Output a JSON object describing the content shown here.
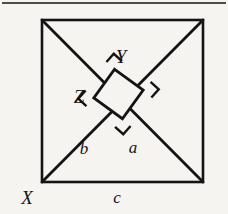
{
  "figure": {
    "kind": "geometry-diagram",
    "background_color": "#f6f4f1",
    "ink_color": "#141414",
    "top_rule": {
      "name": "horizontal-rule",
      "x1": 2,
      "y1": 3,
      "x2": 226,
      "y2": 3,
      "stroke_width": 1.6
    },
    "outer_square": {
      "name": "outer-square",
      "x": 42,
      "y": 20,
      "width": 161,
      "height": 162,
      "stroke_width": 2.6
    },
    "diagonals": [
      {
        "name": "diagonal-top-left-to-bottom-right",
        "x1": 42,
        "y1": 20,
        "x2": 203,
        "y2": 182,
        "stroke_width": 2.8
      },
      {
        "name": "diagonal-bottom-left-to-top-right",
        "x1": 42,
        "y1": 182,
        "x2": 203,
        "y2": 20,
        "stroke_width": 2.8
      }
    ],
    "inner_square": {
      "name": "inner-tilted-square",
      "center_x": 118.5,
      "center_y": 94,
      "half_diagonal": 25,
      "rotation_deg": 42,
      "stroke_width": 2.8,
      "fill": "#f6f4f1",
      "vertices": [
        {
          "x": 114.6,
          "y": 69.3
        },
        {
          "x": 143.2,
          "y": 90.1
        },
        {
          "x": 122.4,
          "y": 118.7
        },
        {
          "x": 93.8,
          "y": 97.9
        }
      ]
    },
    "right_angle_marks": [
      {
        "name": "right-angle-mark-top",
        "cx": 114.6,
        "cy": 69.3,
        "size": 11,
        "rotation_deg": 42
      },
      {
        "name": "right-angle-mark-right",
        "cx": 143.2,
        "cy": 90.1,
        "size": 11,
        "rotation_deg": 132
      },
      {
        "name": "right-angle-mark-bottom",
        "cx": 122.4,
        "cy": 118.7,
        "size": 11,
        "rotation_deg": 222
      },
      {
        "name": "right-angle-mark-left",
        "cx": 93.8,
        "cy": 97.9,
        "size": 11,
        "rotation_deg": 312
      }
    ]
  },
  "labels": {
    "vertex_y": {
      "text": "Y",
      "x": 121,
      "y": 56,
      "style": "capital"
    },
    "vertex_z": {
      "text": "Z",
      "x": 79,
      "y": 96,
      "style": "capital"
    },
    "vertex_x": {
      "text": "X",
      "x": 27,
      "y": 197,
      "style": "capital"
    },
    "side_b": {
      "text": "b",
      "x": 84,
      "y": 148,
      "style": "lowercase"
    },
    "side_a": {
      "text": "a",
      "x": 133,
      "y": 147,
      "style": "lowercase"
    },
    "side_c": {
      "text": "c",
      "x": 117,
      "y": 197,
      "style": "lowercase"
    }
  }
}
